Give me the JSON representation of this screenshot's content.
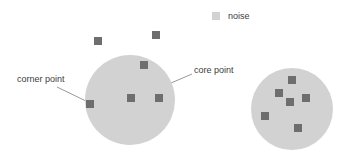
{
  "figure": {
    "width": 354,
    "height": 156,
    "background": "#ffffff"
  },
  "colors": {
    "cluster_fill": "#d2d2d2",
    "point_fill": "#6e6e6e",
    "noise_fill": "#6e6e6e",
    "legend_swatch": "#d2d2d2",
    "text": "#404040",
    "leader_line": "#8c8c8c"
  },
  "legend": {
    "label": "noise",
    "swatch_x": 212,
    "swatch_y": 12,
    "swatch_size": 8,
    "text_x": 228,
    "text_y": 11
  },
  "annotations": [
    {
      "name": "corner-point",
      "label": "corner point",
      "text_x": 17,
      "text_y": 74,
      "line_x1": 57,
      "line_y1": 87,
      "line_x2": 86,
      "line_y2": 101
    },
    {
      "name": "core-point",
      "label": "core point",
      "text_x": 194,
      "text_y": 65,
      "line_x1": 192,
      "line_y1": 74,
      "line_x2": 136,
      "line_y2": 98
    }
  ],
  "clusters": [
    {
      "name": "cluster-left",
      "cx": 130,
      "cy": 100,
      "r": 45
    },
    {
      "name": "cluster-right",
      "cx": 292,
      "cy": 109,
      "r": 41
    }
  ],
  "points": {
    "size": 8,
    "cluster_left": [
      {
        "name": "core-point-center",
        "x": 127,
        "y": 94
      },
      {
        "name": "point-upper-right",
        "x": 140,
        "y": 61
      },
      {
        "name": "point-right",
        "x": 155,
        "y": 94
      },
      {
        "name": "corner-point",
        "x": 86,
        "y": 100
      }
    ],
    "cluster_right": [
      {
        "name": "point-top",
        "x": 288,
        "y": 76
      },
      {
        "name": "point-upper-left",
        "x": 275,
        "y": 89
      },
      {
        "name": "point-middle",
        "x": 286,
        "y": 98
      },
      {
        "name": "point-right",
        "x": 302,
        "y": 94
      },
      {
        "name": "point-lower-left",
        "x": 261,
        "y": 112
      },
      {
        "name": "point-bottom",
        "x": 294,
        "y": 124
      }
    ],
    "noise": [
      {
        "name": "noise-point-left",
        "x": 94,
        "y": 37
      },
      {
        "name": "noise-point-right",
        "x": 152,
        "y": 31
      }
    ]
  }
}
